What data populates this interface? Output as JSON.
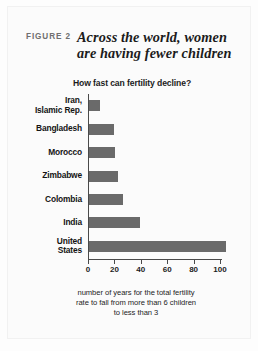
{
  "figure": {
    "label": "FIGURE 2",
    "title_line1": "Across the world, women",
    "title_line2": "are having fewer children",
    "subtitle": "How fast can fertility decline?",
    "footnote_line1": "number of years for the total fertility",
    "footnote_line2": "rate to fall from more than 6 children",
    "footnote_line3": "to less than 3"
  },
  "colors": {
    "bar": "#6a6a6a",
    "axis": "#4a4a4a",
    "text": "#141414",
    "figure_label": "#6f6f6f",
    "background": "#fdfdfd"
  },
  "chart_data": {
    "type": "bar",
    "orientation": "horizontal",
    "title": "Across the world, women are having fewer children",
    "subtitle": "How fast can fertility decline?",
    "xlabel": "number of years for the total fertility rate to fall from more than 6 children to less than 3",
    "ylabel": "",
    "categories": [
      "Iran, Islamic Rep.",
      "Bangladesh",
      "Morocco",
      "Zimbabwe",
      "Colombia",
      "India",
      "United States"
    ],
    "category_lines": [
      [
        "Iran,",
        "Islamic Rep."
      ],
      [
        "Bangladesh"
      ],
      [
        "Morocco"
      ],
      [
        "Zimbabwe"
      ],
      [
        "Colombia"
      ],
      [
        "India"
      ],
      [
        "United",
        "States"
      ]
    ],
    "values": [
      8,
      19,
      20,
      22,
      26,
      39,
      104
    ],
    "xlim": [
      0,
      105
    ],
    "xticks": [
      0,
      20,
      40,
      60,
      80,
      100
    ],
    "xticklabels": [
      "0",
      "20",
      "40",
      "60",
      "80",
      "100"
    ],
    "grid": false,
    "legend": false
  }
}
